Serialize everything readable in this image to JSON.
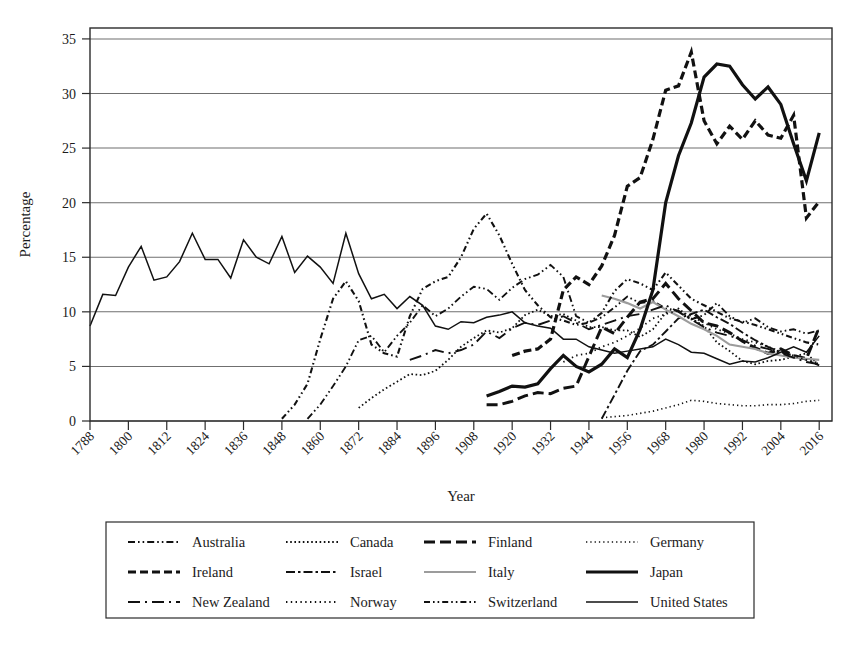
{
  "chart_data": {
    "type": "line",
    "title": "",
    "xlabel": "Year",
    "ylabel": "Percentage",
    "xlim": [
      1788,
      2020
    ],
    "ylim": [
      0,
      36
    ],
    "yticks": [
      0,
      5,
      10,
      15,
      20,
      25,
      30,
      35
    ],
    "xticks": [
      1788,
      1800,
      1812,
      1824,
      1836,
      1848,
      1860,
      1872,
      1884,
      1896,
      1908,
      1920,
      1932,
      1944,
      1956,
      1968,
      1980,
      1992,
      2004,
      2016
    ],
    "grid": "horizontal",
    "legend_position": "below",
    "series": [
      {
        "name": "Australia",
        "dash": "dashdotdot",
        "width": 1.9,
        "color": "#111111",
        "x": [
          1856,
          1860,
          1864,
          1868,
          1872,
          1876,
          1880,
          1884,
          1888,
          1892,
          1896,
          1900,
          1904,
          1908,
          1912,
          1916,
          1920,
          1924,
          1928,
          1932,
          1936,
          1940,
          1944,
          1948,
          1952,
          1956,
          1960,
          1964,
          1968,
          1972,
          1976,
          1980,
          1984,
          1988,
          1992,
          1996,
          2000,
          2004,
          2008,
          2012,
          2016
        ],
        "y": [
          0.2,
          1.5,
          3.2,
          5.0,
          7.4,
          7.8,
          6.3,
          7.8,
          9.0,
          10.6,
          9.6,
          10.3,
          11.4,
          12.3,
          12.1,
          11.1,
          12.2,
          13.0,
          13.4,
          14.3,
          13.2,
          9.6,
          9.0,
          9.5,
          10.4,
          11.4,
          10.8,
          11.0,
          10.3,
          10.1,
          9.3,
          9.7,
          10.8,
          9.6,
          9.0,
          9.4,
          8.6,
          8.2,
          8.4,
          8.0,
          8.3
        ]
      },
      {
        "name": "Canada",
        "dash": "dotted",
        "width": 1.8,
        "color": "#111111",
        "x": [
          1872,
          1876,
          1880,
          1884,
          1888,
          1892,
          1896,
          1900,
          1904,
          1908,
          1912,
          1916,
          1920,
          1924,
          1928,
          1932,
          1936,
          1940,
          1944,
          1948,
          1952,
          1956,
          1960,
          1964,
          1968,
          1972,
          1976,
          1980,
          1984,
          1988,
          1992,
          1996,
          2000,
          2004,
          2008,
          2012,
          2016
        ],
        "y": [
          1.2,
          2.1,
          2.9,
          3.6,
          4.3,
          4.2,
          4.6,
          5.6,
          6.8,
          7.6,
          8.3,
          8.1,
          8.5,
          9.7,
          10.2,
          9.6,
          9.8,
          9.2,
          8.6,
          8.6,
          8.3,
          8.3,
          7.7,
          8.4,
          9.9,
          10.3,
          9.4,
          8.7,
          7.2,
          6.4,
          5.5,
          5.2,
          5.5,
          5.6,
          5.9,
          6.2,
          5.1
        ]
      },
      {
        "name": "Finland",
        "dash": "dashed-thick",
        "width": 3.0,
        "color": "#111111",
        "x": [
          1912,
          1916,
          1920,
          1924,
          1928,
          1932,
          1936,
          1940,
          1944,
          1948,
          1952,
          1956,
          1960,
          1964,
          1968,
          1972,
          1976,
          1980,
          1984,
          1988,
          1992,
          1996,
          2000,
          2004,
          2008,
          2012,
          2016
        ],
        "y": [
          1.5,
          1.5,
          1.8,
          2.3,
          2.6,
          2.5,
          3.0,
          3.2,
          5.9,
          8.6,
          8.0,
          9.5,
          10.9,
          11.2,
          12.6,
          11.2,
          10.1,
          9.0,
          8.7,
          8.1,
          7.3,
          6.7,
          6.2,
          6.6,
          6.0,
          5.7,
          8.6
        ]
      },
      {
        "name": "Germany",
        "dash": "fine-dotted",
        "width": 1.6,
        "color": "#111111",
        "x": [
          1948,
          1952,
          1956,
          1960,
          1964,
          1968,
          1972,
          1976,
          1980,
          1984,
          1988,
          1992,
          1996,
          2000,
          2004,
          2008,
          2012,
          2016
        ],
        "y": [
          0.3,
          0.4,
          0.5,
          0.7,
          0.9,
          1.2,
          1.5,
          1.9,
          1.8,
          1.6,
          1.5,
          1.4,
          1.4,
          1.5,
          1.5,
          1.6,
          1.8,
          1.9
        ]
      },
      {
        "name": "Ireland",
        "dash": "dashed-heavy",
        "width": 3.2,
        "color": "#111111",
        "x": [
          1920,
          1924,
          1928,
          1932,
          1936,
          1940,
          1944,
          1948,
          1952,
          1956,
          1960,
          1964,
          1968,
          1972,
          1976,
          1980,
          1984,
          1988,
          1992,
          1996,
          2000,
          2004,
          2008,
          2012,
          2016
        ],
        "y": [
          6.0,
          6.4,
          6.6,
          7.5,
          12.0,
          13.2,
          12.5,
          14.2,
          17.0,
          21.5,
          22.3,
          25.8,
          30.3,
          30.7,
          33.8,
          27.5,
          25.4,
          27.0,
          25.8,
          27.5,
          26.2,
          25.9,
          28.0,
          18.6,
          20.1
        ]
      },
      {
        "name": "Israel",
        "dash": "dashdot",
        "width": 1.9,
        "color": "#111111",
        "x": [
          1948,
          1952,
          1956,
          1960,
          1964,
          1968,
          1972,
          1976,
          1980,
          1984,
          1988,
          1992,
          1996,
          2000,
          2004,
          2008,
          2012,
          2016
        ],
        "y": [
          0.2,
          2.4,
          4.6,
          6.4,
          7.0,
          8.2,
          9.4,
          9.8,
          10.2,
          9.5,
          8.9,
          8.1,
          7.4,
          6.8,
          6.3,
          6.0,
          5.6,
          5.1
        ]
      },
      {
        "name": "Italy",
        "dash": "solid-gray",
        "width": 2.2,
        "color": "#9c9c9c",
        "x": [
          1948,
          1952,
          1956,
          1960,
          1964,
          1968,
          1972,
          1976,
          1980,
          1984,
          1988,
          1992,
          1996,
          2000,
          2004,
          2008,
          2012,
          2016
        ],
        "y": [
          11.5,
          11.2,
          10.8,
          10.3,
          10.9,
          10.2,
          9.6,
          8.9,
          8.4,
          7.8,
          7.0,
          6.8,
          6.6,
          6.2,
          6.0,
          5.8,
          5.7,
          5.6
        ]
      },
      {
        "name": "Japan",
        "dash": "solid-thick",
        "width": 3.2,
        "color": "#111111",
        "x": [
          1912,
          1916,
          1920,
          1924,
          1928,
          1932,
          1936,
          1940,
          1944,
          1948,
          1952,
          1956,
          1960,
          1964,
          1968,
          1972,
          1976,
          1980,
          1984,
          1988,
          1992,
          1996,
          2000,
          2004,
          2008,
          2012,
          2016
        ],
        "y": [
          2.3,
          2.7,
          3.2,
          3.1,
          3.4,
          4.8,
          6.0,
          5.0,
          4.5,
          5.2,
          6.6,
          5.8,
          8.4,
          12.0,
          20.0,
          24.3,
          27.3,
          31.5,
          32.7,
          32.5,
          30.8,
          29.5,
          30.6,
          29.0,
          25.4,
          22.0,
          26.4
        ]
      },
      {
        "name": "New Zealand",
        "dash": "longdash-dot",
        "width": 1.9,
        "color": "#111111",
        "x": [
          1888,
          1892,
          1896,
          1900,
          1904,
          1908,
          1912,
          1916,
          1920,
          1924,
          1928,
          1932,
          1936,
          1940,
          1944,
          1948,
          1952,
          1956,
          1960,
          1964,
          1968,
          1972,
          1976,
          1980,
          1984,
          1988,
          1992,
          1996,
          2000,
          2004,
          2008,
          2012,
          2016
        ],
        "y": [
          5.6,
          6.0,
          6.5,
          6.2,
          6.5,
          7.0,
          8.2,
          7.6,
          8.5,
          9.0,
          8.8,
          9.2,
          9.6,
          9.0,
          8.4,
          8.8,
          9.2,
          9.6,
          9.8,
          10.2,
          10.6,
          10.0,
          9.3,
          8.6,
          8.1,
          7.8,
          7.4,
          6.9,
          6.6,
          6.2,
          5.8,
          5.4,
          5.2
        ]
      },
      {
        "name": "Norway",
        "dash": "tight-dotted",
        "width": 1.8,
        "color": "#111111",
        "x": [
          1936,
          1940,
          1944,
          1948,
          1952,
          1956,
          1960,
          1964,
          1968,
          1972,
          1976,
          1980,
          1984,
          1988,
          1992,
          1996,
          2000,
          2004,
          2008,
          2012,
          2016
        ],
        "y": [
          5.4,
          6.0,
          6.2,
          6.8,
          7.2,
          7.8,
          8.5,
          9.4,
          9.8,
          10.1,
          9.6,
          9.0,
          8.4,
          8.0,
          7.5,
          7.2,
          6.8,
          6.4,
          6.0,
          5.6,
          5.3
        ]
      },
      {
        "name": "Switzerland",
        "dash": "dashdotdot-sw",
        "width": 2.1,
        "color": "#111111",
        "x": [
          1848,
          1852,
          1856,
          1860,
          1864,
          1868,
          1872,
          1876,
          1880,
          1884,
          1888,
          1892,
          1896,
          1900,
          1904,
          1908,
          1912,
          1916,
          1920,
          1924,
          1928,
          1932,
          1936,
          1940,
          1944,
          1948,
          1952,
          1956,
          1960,
          1964,
          1968,
          1972,
          1976,
          1980,
          1984,
          1988,
          1992,
          1996,
          2000,
          2004,
          2008,
          2012,
          2016
        ],
        "y": [
          0.2,
          1.5,
          3.4,
          7.5,
          11.2,
          12.8,
          11.0,
          7.0,
          6.2,
          5.9,
          9.6,
          12.1,
          12.8,
          13.2,
          15.0,
          17.6,
          19.0,
          17.0,
          14.4,
          12.0,
          10.6,
          9.5,
          9.2,
          8.8,
          9.0,
          9.9,
          11.9,
          13.0,
          12.6,
          12.0,
          13.6,
          12.4,
          11.2,
          10.6,
          10.0,
          9.4,
          9.1,
          8.8,
          8.4,
          8.0,
          7.6,
          7.2,
          7.0
        ]
      },
      {
        "name": "United States",
        "dash": "solid-thin",
        "width": 1.5,
        "color": "#111111",
        "x": [
          1788,
          1792,
          1796,
          1800,
          1804,
          1808,
          1812,
          1816,
          1820,
          1824,
          1828,
          1832,
          1836,
          1840,
          1844,
          1848,
          1852,
          1856,
          1860,
          1864,
          1868,
          1872,
          1876,
          1880,
          1884,
          1888,
          1892,
          1896,
          1900,
          1904,
          1908,
          1912,
          1916,
          1920,
          1924,
          1928,
          1932,
          1936,
          1940,
          1944,
          1948,
          1952,
          1956,
          1960,
          1964,
          1968,
          1972,
          1976,
          1980,
          1984,
          1988,
          1992,
          1996,
          2000,
          2004,
          2008,
          2012,
          2016
        ],
        "y": [
          8.7,
          11.6,
          11.5,
          14.1,
          16.0,
          12.9,
          13.2,
          14.6,
          17.2,
          14.8,
          14.8,
          13.1,
          16.6,
          15.0,
          14.4,
          16.9,
          13.6,
          15.1,
          14.1,
          12.6,
          17.2,
          13.5,
          11.2,
          11.6,
          10.3,
          11.4,
          10.6,
          8.7,
          8.4,
          9.1,
          9.0,
          9.5,
          9.7,
          10.0,
          9.0,
          8.7,
          8.5,
          7.5,
          7.5,
          6.8,
          6.5,
          6.2,
          6.4,
          6.6,
          6.8,
          7.5,
          7.0,
          6.3,
          6.2,
          5.7,
          5.2,
          5.5,
          5.4,
          5.8,
          6.3,
          6.8,
          6.3,
          7.8
        ]
      }
    ]
  },
  "legend": {
    "rows": [
      [
        {
          "label": "Australia",
          "style": "dashdotdot"
        },
        {
          "label": "Canada",
          "style": "dotted"
        },
        {
          "label": "Finland",
          "style": "dashed-thick"
        },
        {
          "label": "Germany",
          "style": "fine-dotted"
        }
      ],
      [
        {
          "label": "Ireland",
          "style": "dashed-heavy"
        },
        {
          "label": "Israel",
          "style": "dashdot"
        },
        {
          "label": "Italy",
          "style": "solid-gray"
        },
        {
          "label": "Japan",
          "style": "solid-thick"
        }
      ],
      [
        {
          "label": "New Zealand",
          "style": "longdash-dot"
        },
        {
          "label": "Norway",
          "style": "tight-dotted"
        },
        {
          "label": "Switzerland",
          "style": "dashdotdot-sw"
        },
        {
          "label": "United States",
          "style": "solid-thin"
        }
      ]
    ]
  },
  "colors": {
    "ink": "#111111",
    "gray_series": "#9c9c9c",
    "gridline": "#6f6f6f",
    "frame": "#2b2b2b",
    "background": "#ffffff"
  }
}
